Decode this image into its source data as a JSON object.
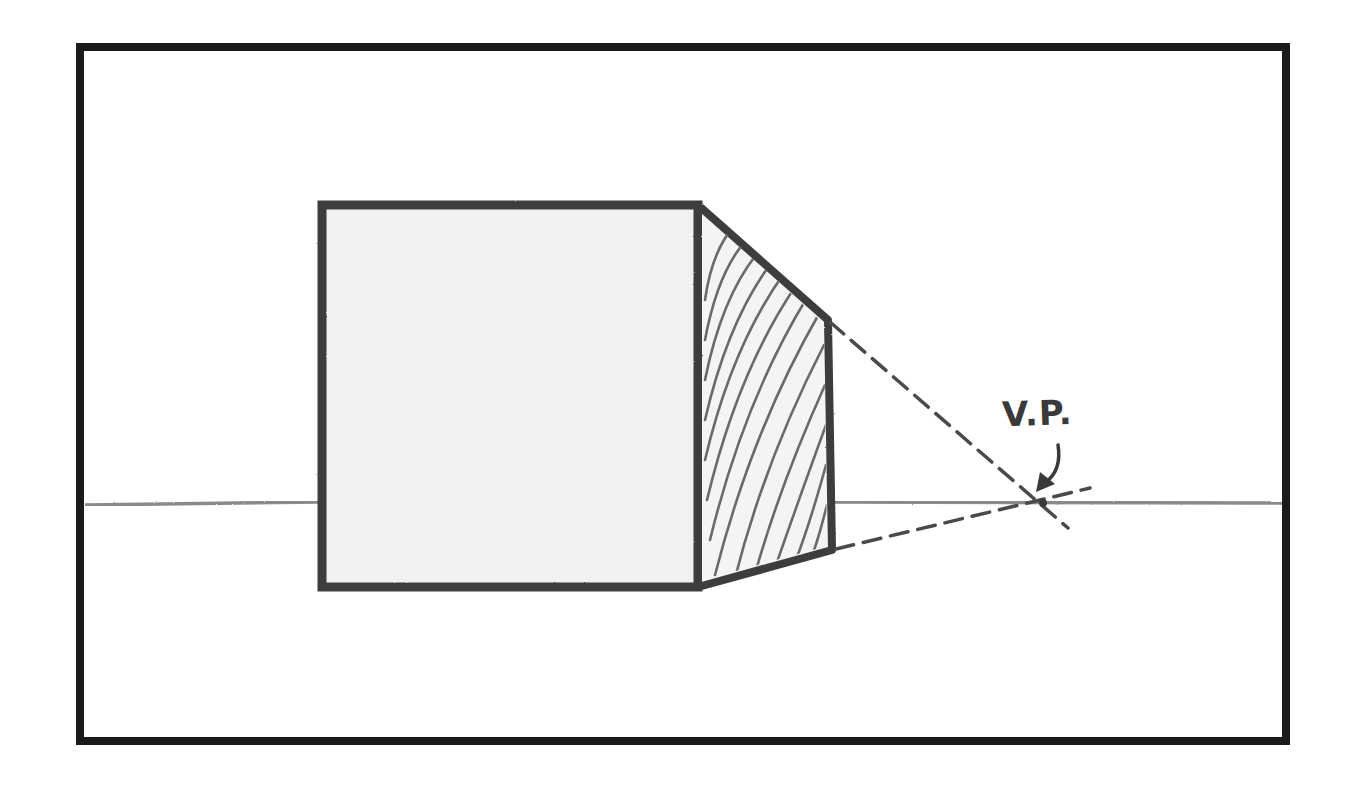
{
  "diagram": {
    "type": "one-point-perspective",
    "label": "V.P.",
    "label_meaning": "vanishing point",
    "colors": {
      "frame": "#1a1a1a",
      "cube_outline": "#3c3c3c",
      "face_fill": "#f1f1f1",
      "hatching": "#6a6a6a",
      "horizon": "#8a8a8a",
      "construction_lines": "#4a4a4a",
      "background": "#ffffff"
    },
    "elements": {
      "frame": {
        "x": 80,
        "y": 46,
        "width": 1206,
        "height": 695
      },
      "horizon_line_y": 503,
      "front_face": {
        "x1": 322,
        "y1": 204,
        "x2": 698,
        "y2": 587
      },
      "side_face": [
        [
          698,
          204
        ],
        [
          828,
          320
        ],
        [
          832,
          550
        ],
        [
          698,
          587
        ]
      ],
      "vanishing_point": {
        "x": 1043,
        "y": 503
      },
      "construction_lines": [
        {
          "from": [
            828,
            320
          ],
          "to": [
            1068,
            528
          ],
          "style": "dashed"
        },
        {
          "from": [
            835,
            550
          ],
          "to": [
            1090,
            488
          ],
          "style": "dashed"
        }
      ]
    }
  }
}
